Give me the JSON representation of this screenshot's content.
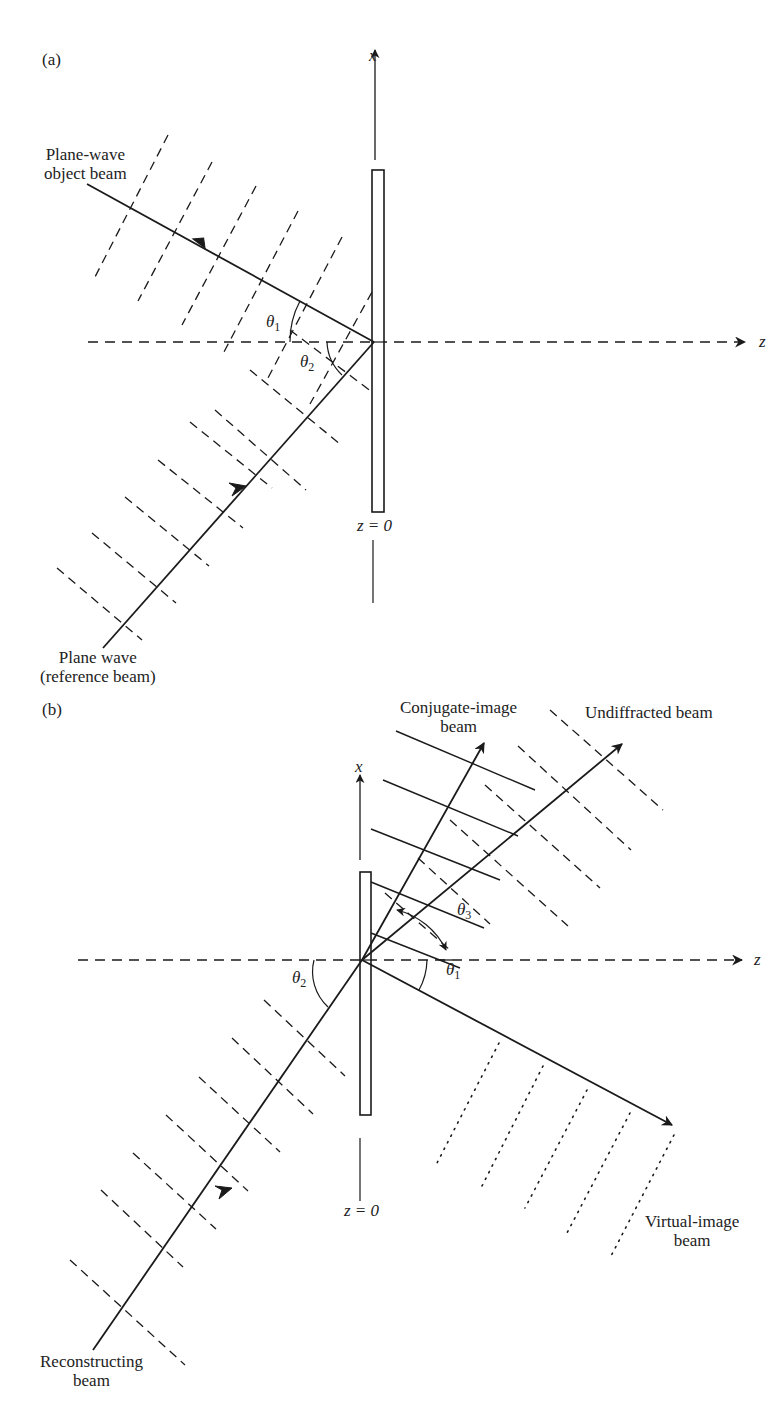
{
  "panels": [
    {
      "id": "a",
      "label": "(a)",
      "axis_x_label": "x",
      "axis_z_label": "z",
      "plate_label": "z = 0",
      "beams": [
        {
          "name": "object",
          "label_line1": "Plane-wave",
          "label_line2": "object beam",
          "wavefront_style": "dashed"
        },
        {
          "name": "reference",
          "label_line1": "Plane wave",
          "label_line2": "(reference beam)",
          "wavefront_style": "dashed"
        }
      ],
      "angles": [
        {
          "symbol": "θ",
          "sub": "1"
        },
        {
          "symbol": "θ",
          "sub": "2"
        }
      ]
    },
    {
      "id": "b",
      "label": "(b)",
      "axis_x_label": "x",
      "axis_z_label": "z",
      "plate_label": "z = 0",
      "beams": [
        {
          "name": "conjugate-image",
          "label_line1": "Conjugate-image",
          "label_line2": "beam",
          "wavefront_style": "solid"
        },
        {
          "name": "undiffracted",
          "label_line1": "Undiffracted beam",
          "wavefront_style": "dashed"
        },
        {
          "name": "virtual-image",
          "label_line1": "Virtual-image",
          "label_line2": "beam",
          "wavefront_style": "dotted"
        },
        {
          "name": "reconstructing",
          "label_line1": "Reconstructing",
          "label_line2": "beam",
          "wavefront_style": "dashed"
        }
      ],
      "angles": [
        {
          "symbol": "θ",
          "sub": "2"
        },
        {
          "symbol": "θ",
          "sub": "3"
        },
        {
          "symbol": "θ",
          "sub": "1"
        }
      ]
    }
  ],
  "colors": {
    "ink": "#1a1a1a",
    "background": "#ffffff"
  }
}
